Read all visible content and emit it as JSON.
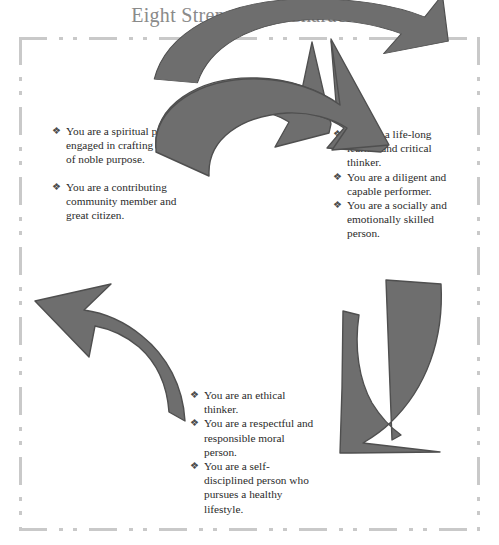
{
  "page": {
    "title": "Eight Strengths of Character",
    "title_color": "#8a8a8a",
    "background_color": "#ffffff",
    "border_color": "#c9c9c9",
    "border_style": "dash-dot-dot",
    "arrow_fill_color": "#6e6e6e",
    "arrow_outline_color": "#4f4f4f",
    "bullet_glyph": "❖",
    "text_color": "#2b2b2b"
  },
  "blocks": {
    "left": {
      "name": "left-strengths-list",
      "items": [
        "You are a spiritual person engaged in crafting a life of noble purpose.",
        "You are a contributing community member and great citizen."
      ]
    },
    "right": {
      "name": "right-strengths-list",
      "items": [
        "You are a life-long learner and critical thinker.",
        "You are a diligent and capable performer.",
        "You are a socially and emotionally skilled person."
      ]
    },
    "bottom": {
      "name": "bottom-strengths-list",
      "items": [
        "You are an ethical thinker.",
        "You are a respectful and responsible moral person.",
        "You are a self-disciplined person who pursues a healthy lifestyle."
      ]
    }
  },
  "arrows": [
    {
      "name": "arrow-top-curved-right",
      "direction": "right-down",
      "fill": "#6e6e6e"
    },
    {
      "name": "arrow-right-curved-down-left",
      "direction": "down-left",
      "fill": "#6e6e6e"
    },
    {
      "name": "arrow-left-curved-up-left",
      "direction": "up-left",
      "fill": "#6e6e6e"
    }
  ]
}
